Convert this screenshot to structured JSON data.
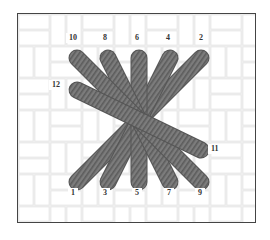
{
  "diagram": {
    "type": "embroidery-stitch-diagram",
    "colors": {
      "frame_border": "#444444",
      "fabric_light": "#ffffff",
      "fabric_shade": "#e8e8e8",
      "stitch_fill": "#7a7a7a",
      "stitch_stripe": "#5e5e5e",
      "label_text": "#333333"
    },
    "top_labels": [
      {
        "text": "10",
        "x": 70,
        "y": 38
      },
      {
        "text": "8",
        "x": 104,
        "y": 38
      },
      {
        "text": "6",
        "x": 136,
        "y": 38
      },
      {
        "text": "4",
        "x": 167,
        "y": 38
      },
      {
        "text": "2",
        "x": 200,
        "y": 38
      }
    ],
    "side_labels": [
      {
        "text": "12",
        "x": 53,
        "y": 85
      },
      {
        "text": "11",
        "x": 212,
        "y": 149
      }
    ],
    "bottom_labels": [
      {
        "text": "1",
        "x": 72,
        "y": 193
      },
      {
        "text": "3",
        "x": 104,
        "y": 193
      },
      {
        "text": "5",
        "x": 136,
        "y": 193
      },
      {
        "text": "7",
        "x": 168,
        "y": 193
      },
      {
        "text": "9",
        "x": 199,
        "y": 193
      }
    ],
    "stitches": [
      {
        "from": "1",
        "to": "2",
        "x1": 59,
        "y1": 168,
        "x2": 183,
        "y2": 44
      },
      {
        "from": "3",
        "to": "4",
        "x1": 90,
        "y1": 168,
        "x2": 152,
        "y2": 44
      },
      {
        "from": "5",
        "to": "6",
        "x1": 121,
        "y1": 168,
        "x2": 121,
        "y2": 44
      },
      {
        "from": "7",
        "to": "8",
        "x1": 152,
        "y1": 168,
        "x2": 90,
        "y2": 44
      },
      {
        "from": "9",
        "to": "10",
        "x1": 183,
        "y1": 168,
        "x2": 59,
        "y2": 44
      },
      {
        "from": "11",
        "to": "12",
        "x1": 183,
        "y1": 136,
        "x2": 59,
        "y2": 76
      }
    ]
  }
}
